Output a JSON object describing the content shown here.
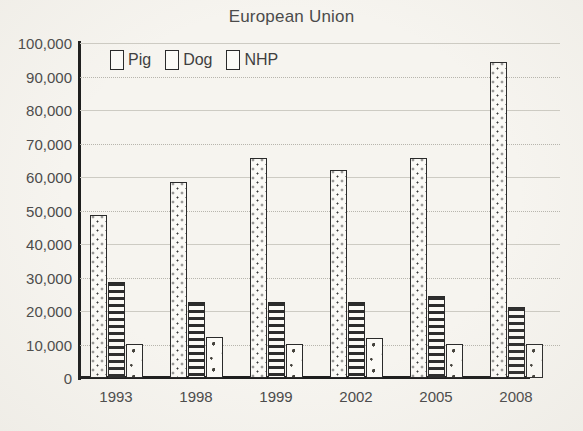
{
  "chart_data": {
    "type": "bar",
    "title": "European Union",
    "xlabel": "",
    "ylabel": "",
    "categories": [
      "1993",
      "1998",
      "1999",
      "2002",
      "2005",
      "2008"
    ],
    "series": [
      {
        "name": "Pig",
        "pattern": "vertical-dots",
        "values": [
          48800,
          58500,
          65800,
          62200,
          65800,
          94300
        ]
      },
      {
        "name": "Dog",
        "pattern": "horizontal-stripes",
        "values": [
          28800,
          22700,
          22700,
          22600,
          24500,
          21300
        ]
      },
      {
        "name": "NHP",
        "pattern": "sparse-flecks",
        "values": [
          10200,
          12200,
          10300,
          12000,
          10200,
          10200
        ]
      }
    ],
    "ylim": [
      0,
      100000
    ],
    "ytick_values": [
      0,
      10000,
      20000,
      30000,
      40000,
      50000,
      60000,
      70000,
      80000,
      90000,
      100000
    ],
    "ytick_labels": [
      "0",
      "10,000",
      "20,000",
      "30,000",
      "40,000",
      "50,000",
      "60,000",
      "70,000",
      "80,000",
      "90,000",
      "100,000"
    ],
    "grid": true,
    "grid_axis": "y",
    "legend_position": "top-left-inside",
    "legend": [
      "Pig",
      "Dog",
      "NHP"
    ]
  },
  "colors": {
    "background": "#f6f4ef",
    "bar_fill": "#fbfaf6",
    "bar_stroke": "#2a2a2a",
    "axis": "#1d1d1d",
    "gridline": "#b7b5ad",
    "text": "#4a4a4a"
  }
}
